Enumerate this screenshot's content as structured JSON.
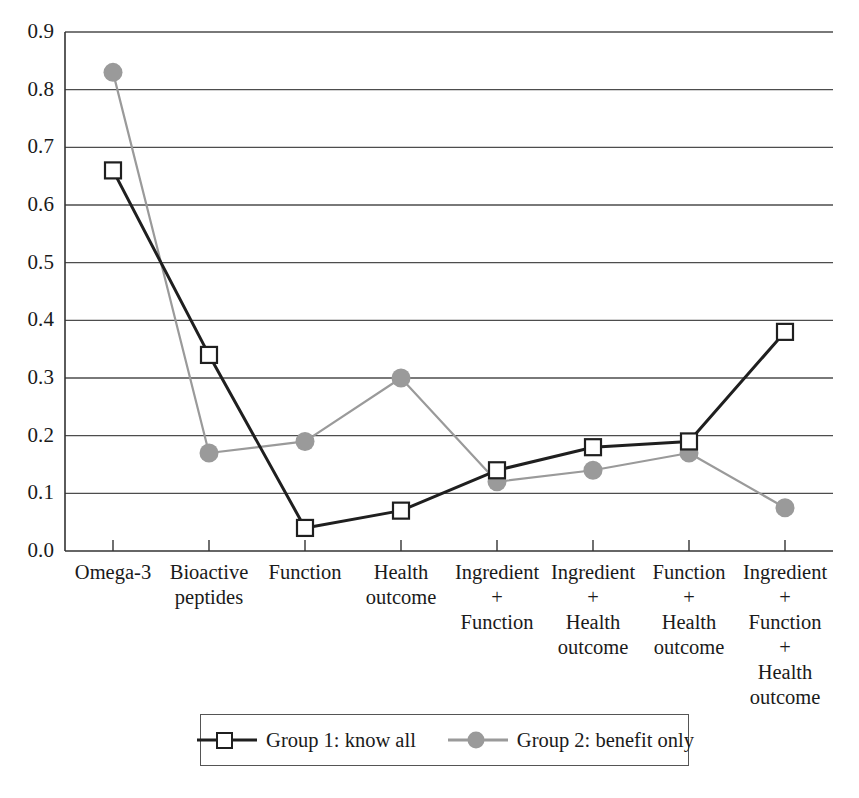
{
  "chart_data": {
    "type": "line",
    "title": "",
    "xlabel": "",
    "ylabel": "",
    "ylim": [
      0.0,
      0.9
    ],
    "ytick_step": 0.1,
    "grid": true,
    "legend_position": "bottom",
    "categories": [
      "Omega-3",
      "Bioactive\npeptides",
      "Function",
      "Health\noutcome",
      "Ingredient\n+\nFunction",
      "Ingredient\n+\nHealth\noutcome",
      "Function\n+\nHealth\noutcome",
      "Ingredient\n+\nFunction\n+\nHealth\noutcome"
    ],
    "ytick_labels": [
      "0.9",
      "0.8",
      "0.7",
      "0.6",
      "0.5",
      "0.4",
      "0.3",
      "0.2",
      "0.1",
      "0.0"
    ],
    "ytick_values": [
      0.9,
      0.8,
      0.7,
      0.6,
      0.5,
      0.4,
      0.3,
      0.2,
      0.1,
      0.0
    ],
    "series": [
      {
        "name": "Group 1: know all",
        "color": "#1f1f1f",
        "marker": "open-square",
        "values": [
          0.66,
          0.34,
          0.04,
          0.07,
          0.14,
          0.18,
          0.19,
          0.38
        ]
      },
      {
        "name": "Group 2: benefit only",
        "color": "#9a9a9a",
        "marker": "filled-circle",
        "values": [
          0.83,
          0.17,
          0.19,
          0.3,
          0.12,
          0.14,
          0.17,
          0.075
        ]
      }
    ]
  },
  "legend": {
    "entries": [
      {
        "label": "Group 1: know all"
      },
      {
        "label": "Group 2: benefit only"
      }
    ]
  },
  "colors": {
    "series1": "#1f1f1f",
    "series2": "#9a9a9a",
    "axis": "#333333",
    "grid": "#4d4d4d",
    "background": "#ffffff"
  }
}
